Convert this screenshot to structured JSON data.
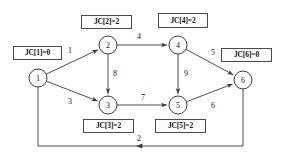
{
  "diagram": {
    "type": "directed-weighted-graph",
    "nodes": [
      {
        "id": "1",
        "label": "1",
        "cx": 38,
        "cy": 78
      },
      {
        "id": "2",
        "label": "2",
        "cx": 108,
        "cy": 45
      },
      {
        "id": "3",
        "label": "3",
        "cx": 108,
        "cy": 105
      },
      {
        "id": "4",
        "label": "4",
        "cx": 178,
        "cy": 45
      },
      {
        "id": "5",
        "label": "5",
        "cx": 178,
        "cy": 105
      },
      {
        "id": "6",
        "label": "6",
        "cx": 243,
        "cy": 80
      }
    ],
    "node_radius": 9,
    "edges": [
      {
        "from": "1",
        "to": "2",
        "weight": "1",
        "lx": 70,
        "ly": 50
      },
      {
        "from": "1",
        "to": "3",
        "weight": "3",
        "lx": 70,
        "ly": 101
      },
      {
        "from": "2",
        "to": "3",
        "weight": "8",
        "lx": 115,
        "ly": 73
      },
      {
        "from": "2",
        "to": "4",
        "weight": "4",
        "lx": 139,
        "ly": 36
      },
      {
        "from": "3",
        "to": "5",
        "weight": "7",
        "lx": 143,
        "ly": 97
      },
      {
        "from": "4",
        "to": "5",
        "weight": "9",
        "lx": 186,
        "ly": 73
      },
      {
        "from": "4",
        "to": "6",
        "weight": "5",
        "lx": 213,
        "ly": 52
      },
      {
        "from": "5",
        "to": "6",
        "weight": "6",
        "lx": 213,
        "ly": 105
      },
      {
        "from": "6",
        "to": "1",
        "weight": "2",
        "lx": 139,
        "ly": 138
      }
    ],
    "jc_boxes": [
      {
        "name": "jc-1",
        "text": "JC[1]=0",
        "x": 13,
        "y": 46,
        "w": 49,
        "h": 14
      },
      {
        "name": "jc-2",
        "text": "JC[2]=2",
        "x": 81,
        "y": 15,
        "w": 51,
        "h": 14
      },
      {
        "name": "jc-4",
        "text": "JC[4]=2",
        "x": 158,
        "y": 13,
        "w": 50,
        "h": 15
      },
      {
        "name": "jc-6",
        "text": "JC[6]=0",
        "x": 221,
        "y": 48,
        "w": 51,
        "h": 14
      },
      {
        "name": "jc-3",
        "text": "JC[3]=2",
        "x": 83,
        "y": 119,
        "w": 51,
        "h": 14
      },
      {
        "name": "jc-5",
        "text": "JC[5]=2",
        "x": 155,
        "y": 119,
        "w": 51,
        "h": 14
      }
    ],
    "colors": {
      "stroke": "#3a3a3a",
      "box_border": "#4a4a4a",
      "text": "#111111",
      "background": "#ffffff"
    }
  }
}
